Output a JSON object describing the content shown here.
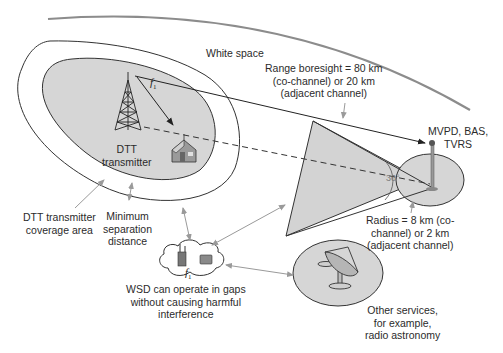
{
  "diagram": {
    "colors": {
      "region_fill": "#d6d6d6",
      "outline": "#333333",
      "gray_arrow": "#9a9a9a",
      "white_space_arc": "#8c8c8c",
      "background": "#ffffff"
    },
    "labels": {
      "white_space": "White space",
      "dtt_transmitter": [
        "DTT",
        "transmitter"
      ],
      "f1_tower": "f",
      "f1_sub": "1",
      "range_boresight": [
        "Range boresight = 80 km",
        "(co-channel) or 20 km",
        "(adjacent channel)"
      ],
      "mvpd": [
        "MVPD, BAS,",
        "TVRS"
      ],
      "angle": "30°",
      "radius": [
        "Radius = 8 km (co-",
        "channel) or 2 km",
        "(adjacent channel)"
      ],
      "dtt_coverage": [
        "DTT transmitter",
        "coverage area"
      ],
      "min_separation": [
        "Minimum",
        "separation",
        "distance"
      ],
      "wsd": [
        "WSD can operate in gaps",
        "without causing harmful",
        "interference"
      ],
      "other_services": [
        "Other services,",
        "for example,",
        "radio astronomy"
      ]
    },
    "elements": [
      "white-space-boundary-arc",
      "dtt-coverage-area",
      "minimum-separation-contour",
      "dtt-transmitter-tower",
      "receiver-house",
      "mvpd-bas-tvrs-protection-wedge",
      "mvpd-receive-site-circle",
      "wsd-cloud",
      "radio-astronomy-region"
    ]
  }
}
